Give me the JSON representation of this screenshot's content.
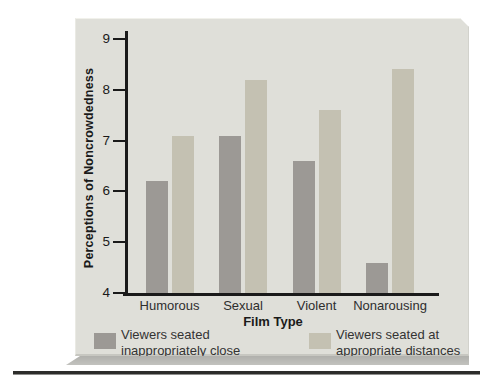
{
  "chart_data": {
    "type": "bar",
    "title": "",
    "categories": [
      "Humorous",
      "Sexual",
      "Violent",
      "Nonarousing"
    ],
    "series": [
      {
        "name": "Viewers seated inappropriately close",
        "color": "#9c9995",
        "values": [
          6.2,
          7.1,
          6.6,
          4.6
        ]
      },
      {
        "name": "Viewers seated at appropriate distances",
        "color": "#c4c1b2",
        "values": [
          7.1,
          8.2,
          7.6,
          8.4
        ]
      }
    ],
    "xlabel": "Film Type",
    "ylabel": "Perceptions of Noncrowdedness",
    "ylim": [
      4,
      9
    ],
    "yticks": [
      4,
      5,
      6,
      7,
      8,
      9
    ],
    "grid": false,
    "legend_position": "bottom",
    "legend_items": [
      {
        "lines": [
          "Viewers seated",
          "inappropriately close"
        ],
        "color": "#9c9995"
      },
      {
        "lines": [
          "Viewers seated at",
          "appropriate distances"
        ],
        "color": "#c4c1b2"
      }
    ]
  },
  "colors": {
    "page_bg": "#ffffff",
    "panel_bg": "#dfdfd9",
    "axis": "#1a1a1a",
    "bar_close": "#9c9995",
    "bar_far": "#c4c1b2",
    "panel_shadow": "#b4b4b0",
    "bottom_rule": "#2d2d2b"
  }
}
